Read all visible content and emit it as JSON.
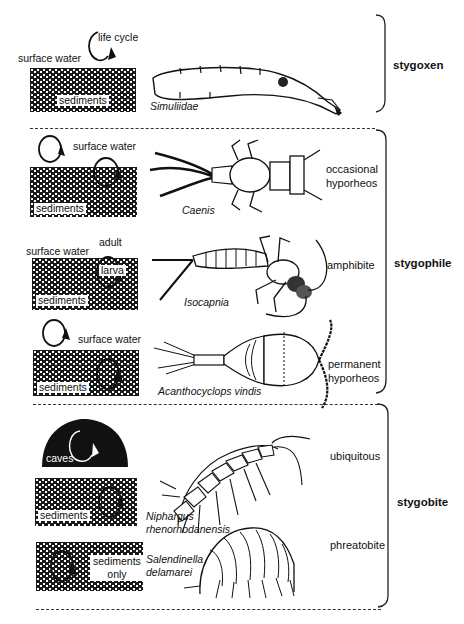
{
  "figure": {
    "categories": [
      {
        "label": "stygoxen"
      },
      {
        "label": "stygophile"
      },
      {
        "label": "stygobite"
      }
    ],
    "rows": [
      {
        "habitat": "",
        "taxon": "Simuliidae",
        "labels": {
          "surface": "surface water",
          "cycle": "life cycle",
          "sediments": "sediments"
        }
      },
      {
        "habitat_line1": "occasional",
        "habitat_line2": "hyporheos",
        "taxon": "Caenis",
        "labels": {
          "surface": "surface water",
          "sediments": "sediments"
        }
      },
      {
        "habitat": "amphibite",
        "taxon": "Isocapnia",
        "labels": {
          "surface": "surface water",
          "adult": "adult",
          "larva": "larva",
          "sediments": "sediments"
        }
      },
      {
        "habitat_line1": "permanent",
        "habitat_line2": "hyporheos",
        "taxon": "Acanthocyclops vindis",
        "labels": {
          "surface": "surface water",
          "sediments": "sediments"
        }
      },
      {
        "habitat": "ubiquitous",
        "taxon_line1": "Niphargus",
        "taxon_line2": "rhenorhodanensis",
        "labels": {
          "caves": "caves",
          "sediments": "sediments"
        }
      },
      {
        "habitat": "phreatobite",
        "taxon_line1": "Salendinella",
        "taxon_line2": "delamarei",
        "labels": {
          "sediments_line1": "sediments",
          "sediments_line2": "only"
        }
      }
    ]
  }
}
